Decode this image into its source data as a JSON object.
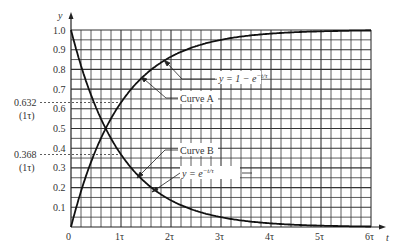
{
  "chart_data": {
    "type": "line",
    "title": "",
    "xlabel": "t",
    "ylabel": "y",
    "xlim": [
      0,
      6
    ],
    "ylim": [
      0,
      1.0
    ],
    "grid": true,
    "x_tick_labels": [
      "0",
      "1τ",
      "2τ",
      "3τ",
      "4τ",
      "5τ",
      "6τ"
    ],
    "y_tick_labels": [
      "0.1",
      "0.2",
      "0.3",
      "0.4",
      "0.5",
      "0.6",
      "0.7",
      "0.8",
      "0.9",
      "1.0"
    ],
    "x": [
      0,
      0.5,
      1,
      1.5,
      2,
      2.5,
      3,
      3.5,
      4,
      4.5,
      5,
      5.5,
      6
    ],
    "series": [
      {
        "name": "Curve A",
        "equation": "y = 1 − e^(−t/τ)",
        "values": [
          0,
          0.393,
          0.632,
          0.777,
          0.865,
          0.918,
          0.95,
          0.97,
          0.982,
          0.989,
          0.993,
          0.996,
          0.998
        ]
      },
      {
        "name": "Curve B",
        "equation": "y = e^(−t/τ)",
        "values": [
          1,
          0.607,
          0.368,
          0.223,
          0.135,
          0.082,
          0.05,
          0.03,
          0.018,
          0.011,
          0.007,
          0.004,
          0.002
        ]
      }
    ],
    "annotations": [
      {
        "text": "0.632",
        "sub": "(1τ)",
        "y": 0.632
      },
      {
        "text": "0.368",
        "sub": "(1τ)",
        "y": 0.368
      },
      {
        "text": "y = 1 − e^(−t/τ)",
        "target": "Curve A"
      },
      {
        "text": "Curve A"
      },
      {
        "text": "Curve B"
      },
      {
        "text": "y = e^(−t/τ)",
        "target": "Curve B"
      }
    ]
  },
  "labels": {
    "y_axis": "y",
    "x_axis": "t",
    "origin": "0",
    "ann_632": "0.632",
    "ann_632_sub": "(1τ)",
    "ann_368": "0.368",
    "ann_368_sub": "(1τ)",
    "curve_a": "Curve A",
    "curve_b": "Curve B",
    "eq_a_prefix": "y = 1 − e",
    "eq_a_exp": "−t/τ",
    "eq_b_prefix": "y = e",
    "eq_b_exp": "−t/τ",
    "x_ticks": [
      "1τ",
      "2τ",
      "3τ",
      "4τ",
      "5τ",
      "6τ"
    ],
    "y_ticks": [
      "0.1",
      "0.2",
      "0.3",
      "0.4",
      "0.5",
      "0.6",
      "0.7",
      "0.8",
      "0.9",
      "1.0"
    ]
  }
}
